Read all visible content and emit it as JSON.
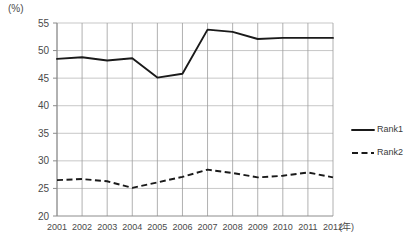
{
  "chart_data": {
    "type": "line",
    "title": "",
    "xlabel": "(年)",
    "ylabel": "(%)",
    "ylim": [
      20,
      55
    ],
    "yticks": [
      20,
      25,
      30,
      35,
      40,
      45,
      50,
      55
    ],
    "categories": [
      "2001",
      "2002",
      "2003",
      "2004",
      "2005",
      "2006",
      "2007",
      "2008",
      "2009",
      "2010",
      "2011",
      "2012"
    ],
    "grid": true,
    "legend_position": "right",
    "series": [
      {
        "name": "Rank1",
        "style": "solid",
        "color": "#1a1a1a",
        "values": [
          48.5,
          48.8,
          48.2,
          48.6,
          45.1,
          45.8,
          53.8,
          53.4,
          52.1,
          52.3,
          52.3,
          52.3
        ]
      },
      {
        "name": "Rank2",
        "style": "dashed",
        "color": "#1a1a1a",
        "values": [
          26.5,
          26.7,
          26.3,
          25.1,
          26.1,
          27.1,
          28.4,
          27.8,
          27.0,
          27.3,
          27.9,
          27.0
        ]
      }
    ]
  },
  "legend": {
    "items": [
      {
        "label": "Rank1"
      },
      {
        "label": "Rank2"
      }
    ]
  },
  "axis": {
    "y_unit": "(%)",
    "x_unit": "(年)"
  }
}
